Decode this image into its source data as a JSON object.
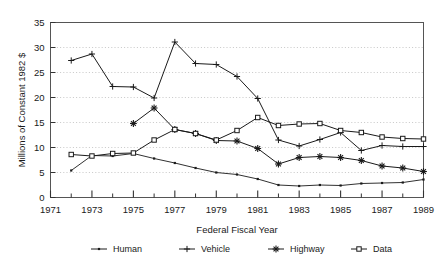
{
  "chart_data": {
    "type": "line",
    "title": "",
    "xlabel": "Federal Fiscal Year",
    "ylabel": "Millions of Constant 1982 $",
    "xlim": [
      1971,
      1989
    ],
    "ylim": [
      0,
      35
    ],
    "ytick_values": [
      0,
      5,
      10,
      15,
      20,
      25,
      30,
      35
    ],
    "ytick_labels": [
      "0",
      "5",
      "10",
      "15",
      "20",
      "25",
      "30",
      "35"
    ],
    "xtick_values": [
      1971,
      1973,
      1975,
      1977,
      1979,
      1981,
      1983,
      1985,
      1987,
      1989
    ],
    "xtick_labels": [
      "1971",
      "1973",
      "1975",
      "1977",
      "1979",
      "1981",
      "1983",
      "1985",
      "1987",
      "1989"
    ],
    "xminor_values": [
      1972,
      1974,
      1976,
      1978,
      1980,
      1982,
      1984,
      1986,
      1988
    ],
    "grid": "horizontal-dotted",
    "legend_position": "below",
    "x": [
      1972,
      1973,
      1974,
      1975,
      1976,
      1977,
      1978,
      1979,
      1980,
      1981,
      1982,
      1983,
      1984,
      1985,
      1986,
      1987,
      1988,
      1989
    ],
    "series": [
      {
        "name": "Human",
        "marker": "dot",
        "color": "#1a1a1a",
        "x": [
          1972,
          1973,
          1974,
          1975,
          1976,
          1977,
          1978,
          1979,
          1980,
          1981,
          1982,
          1983,
          1984,
          1985,
          1986,
          1987,
          1988,
          1989
        ],
        "values": [
          5.4,
          8.4,
          8.3,
          8.8,
          7.8,
          6.9,
          5.9,
          5.0,
          4.6,
          3.7,
          2.5,
          2.3,
          2.5,
          2.4,
          2.8,
          2.9,
          3.0,
          3.6
        ]
      },
      {
        "name": "Vehicle",
        "marker": "plus",
        "color": "#1a1a1a",
        "x": [
          1972,
          1973,
          1974,
          1975,
          1976,
          1977,
          1978,
          1979,
          1980,
          1981,
          1982,
          1983,
          1984,
          1985,
          1986,
          1987,
          1988,
          1989
        ],
        "values": [
          27.4,
          28.7,
          22.2,
          22.1,
          19.9,
          31.1,
          26.8,
          26.6,
          24.2,
          19.8,
          11.5,
          10.3,
          11.6,
          13.0,
          9.4,
          10.4,
          10.2,
          10.2
        ]
      },
      {
        "name": "Highway",
        "marker": "star",
        "color": "#1a1a1a",
        "x": [
          1975,
          1976,
          1977,
          1978,
          1979,
          1980,
          1981,
          1982,
          1983,
          1984,
          1985,
          1986,
          1987,
          1988,
          1989
        ],
        "values": [
          14.8,
          17.9,
          13.6,
          12.8,
          11.4,
          11.3,
          9.8,
          6.7,
          8.0,
          8.2,
          8.0,
          7.4,
          6.3,
          5.9,
          5.2
        ]
      },
      {
        "name": "Data",
        "marker": "square",
        "color": "#1a1a1a",
        "x": [
          1972,
          1973,
          1974,
          1975,
          1976,
          1977,
          1978,
          1979,
          1980,
          1981,
          1982,
          1983,
          1984,
          1985,
          1986,
          1987,
          1988,
          1989
        ],
        "values": [
          8.6,
          8.3,
          8.8,
          8.9,
          11.5,
          13.6,
          12.8,
          11.5,
          13.4,
          16.0,
          14.4,
          14.7,
          14.8,
          13.4,
          13.0,
          12.1,
          11.8,
          11.7
        ]
      }
    ]
  },
  "legend": {
    "items": [
      {
        "label": "Human",
        "marker": "dot"
      },
      {
        "label": "Vehicle",
        "marker": "plus"
      },
      {
        "label": "Highway",
        "marker": "star"
      },
      {
        "label": "Data",
        "marker": "square"
      }
    ]
  }
}
